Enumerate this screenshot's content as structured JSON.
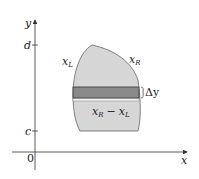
{
  "diagram": {
    "axes": {
      "x_label": "x",
      "y_label": "y",
      "origin_label": "0",
      "y_ticks": [
        {
          "label": "d",
          "y": 45
        },
        {
          "label": "c",
          "y": 131
        }
      ]
    },
    "region": {
      "fill": "#d6d6d6",
      "stroke": "#555555",
      "left_boundary_label": "x",
      "left_boundary_sub": "L",
      "right_boundary_label": "x",
      "right_boundary_sub": "R"
    },
    "strip": {
      "fill": "#8a8a8a",
      "stroke": "#333333",
      "thickness_label": "Δy",
      "width_label_a": "x",
      "width_label_a_sub": "R",
      "width_label_minus": "−",
      "width_label_b": "x",
      "width_label_b_sub": "L"
    }
  }
}
